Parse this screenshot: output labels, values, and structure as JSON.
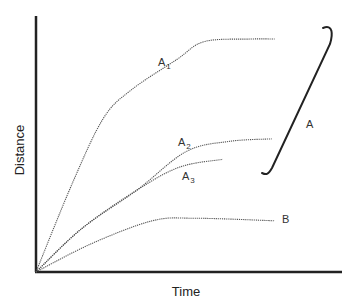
{
  "chart_data": {
    "type": "line",
    "title": "",
    "xlabel": "Time",
    "ylabel": "Distance",
    "xlim": [
      0,
      100
    ],
    "ylim": [
      0,
      100
    ],
    "grid": false,
    "ticks": "none",
    "series": [
      {
        "name": "A1",
        "label": "A",
        "sub": "1",
        "x": [
          0,
          12,
          22,
          31,
          46,
          55,
          70,
          78
        ],
        "y": [
          0,
          35,
          60,
          71,
          83,
          90,
          91,
          91
        ]
      },
      {
        "name": "A2",
        "label": "A",
        "sub": "2",
        "x": [
          0,
          15,
          33,
          49,
          63,
          77
        ],
        "y": [
          0,
          17,
          32,
          47,
          51,
          52
        ]
      },
      {
        "name": "A3",
        "label": "A",
        "sub": "3",
        "x": [
          0,
          15,
          33,
          47,
          61
        ],
        "y": [
          0,
          17,
          32,
          41,
          44
        ]
      },
      {
        "name": "B",
        "label": "B",
        "sub": "",
        "x": [
          0,
          18,
          38,
          52,
          78
        ],
        "y": [
          0,
          11,
          20,
          21,
          20
        ]
      }
    ],
    "annotations": [
      {
        "type": "brace",
        "label": "A",
        "groups": [
          "A1",
          "A2",
          "A3"
        ]
      }
    ]
  }
}
